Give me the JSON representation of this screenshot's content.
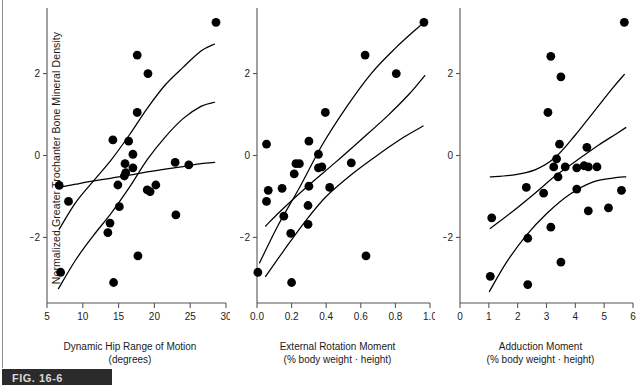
{
  "figure": {
    "caption_label": "FIG. 16-6",
    "shared_ylabel": "Normalized Greater Trochanter Bone Mineral Density",
    "ink_color": "#000000",
    "axis_color": "#555555",
    "background": "#ffffff"
  },
  "chart_data": [
    {
      "type": "scatter",
      "title": "",
      "xlabel": "Dynamic Hip Range of Motion",
      "xlabel_units": "(degrees)",
      "ylabel": "Normalized Greater Trochanter Bone Mineral Density",
      "xlim": [
        5,
        30
      ],
      "ylim": [
        -3.6,
        3.6
      ],
      "xticks": [
        5,
        10,
        15,
        20,
        25,
        30
      ],
      "xticklabels": [
        "5",
        "10",
        "15",
        "20",
        "25",
        "30"
      ],
      "yticks": [
        2,
        0,
        -2
      ],
      "yticklabels": [
        "2",
        "0",
        "-2"
      ],
      "grid": false,
      "legend": "none",
      "points": [
        [
          28.6,
          3.25
        ],
        [
          17.6,
          2.45
        ],
        [
          19.1,
          2.0
        ],
        [
          17.6,
          1.05
        ],
        [
          14.2,
          0.38
        ],
        [
          16.4,
          0.35
        ],
        [
          17.0,
          0.03
        ],
        [
          15.9,
          -0.2
        ],
        [
          17.0,
          -0.3
        ],
        [
          22.9,
          -0.17
        ],
        [
          24.8,
          -0.23
        ],
        [
          16.0,
          -0.42
        ],
        [
          15.8,
          -0.5
        ],
        [
          14.9,
          -0.72
        ],
        [
          6.7,
          -0.73
        ],
        [
          20.2,
          -0.72
        ],
        [
          19.4,
          -0.88
        ],
        [
          19.0,
          -0.84
        ],
        [
          8.0,
          -1.12
        ],
        [
          15.1,
          -1.25
        ],
        [
          23.0,
          -1.45
        ],
        [
          13.8,
          -1.65
        ],
        [
          13.5,
          -1.88
        ],
        [
          17.7,
          -2.45
        ],
        [
          6.9,
          -2.85
        ],
        [
          14.3,
          -3.1
        ]
      ],
      "curves": [
        {
          "name": "upper-confidence-band",
          "points": [
            [
              6.7,
              -1.8
            ],
            [
              9,
              -1.15
            ],
            [
              11.5,
              -0.62
            ],
            [
              14,
              -0.1
            ],
            [
              16.5,
              0.5
            ],
            [
              19,
              1.15
            ],
            [
              21.5,
              1.72
            ],
            [
              24,
              2.15
            ],
            [
              26.5,
              2.55
            ],
            [
              28.4,
              2.72
            ]
          ]
        },
        {
          "name": "regression-fit",
          "points": [
            [
              6.6,
              -3.25
            ],
            [
              9,
              -2.55
            ],
            [
              11.5,
              -1.95
            ],
            [
              14,
              -1.4
            ],
            [
              16.5,
              -0.78
            ],
            [
              19,
              -0.1
            ],
            [
              21.5,
              0.45
            ],
            [
              24,
              0.9
            ],
            [
              26.5,
              1.2
            ],
            [
              28.4,
              1.3
            ]
          ]
        },
        {
          "name": "lower-confidence-band",
          "points": [
            [
              6.6,
              -0.78
            ],
            [
              9,
              -0.7
            ],
            [
              11.5,
              -0.62
            ],
            [
              14,
              -0.55
            ],
            [
              16.5,
              -0.48
            ],
            [
              19,
              -0.4
            ],
            [
              21.5,
              -0.33
            ],
            [
              24,
              -0.27
            ],
            [
              26.5,
              -0.2
            ],
            [
              28.4,
              -0.17
            ]
          ]
        }
      ]
    },
    {
      "type": "scatter",
      "title": "",
      "xlabel": "External Rotation Moment",
      "xlabel_units": "(% body weight · height)",
      "ylabel": "Normalized Greater Trochanter Bone Mineral Density",
      "xlim": [
        0.0,
        1.0
      ],
      "ylim": [
        -3.6,
        3.6
      ],
      "xticks": [
        0.0,
        0.2,
        0.4,
        0.6,
        0.8,
        1.0
      ],
      "xticklabels": [
        "0.0",
        "0.2",
        "0.4",
        "0.6",
        "0.8",
        "1.0"
      ],
      "yticks": [
        2,
        0,
        -2
      ],
      "yticklabels": [
        "2",
        "0",
        "-2"
      ],
      "grid": false,
      "legend": "none",
      "points": [
        [
          0.965,
          3.25
        ],
        [
          0.625,
          2.45
        ],
        [
          0.805,
          2.0
        ],
        [
          0.395,
          1.05
        ],
        [
          0.055,
          0.28
        ],
        [
          0.3,
          0.35
        ],
        [
          0.355,
          0.03
        ],
        [
          0.225,
          -0.2
        ],
        [
          0.245,
          -0.2
        ],
        [
          0.545,
          -0.18
        ],
        [
          0.375,
          -0.28
        ],
        [
          0.355,
          -0.3
        ],
        [
          0.215,
          -0.45
        ],
        [
          0.065,
          -0.85
        ],
        [
          0.145,
          -0.8
        ],
        [
          0.3,
          -0.75
        ],
        [
          0.42,
          -0.78
        ],
        [
          0.055,
          -1.12
        ],
        [
          0.295,
          -1.22
        ],
        [
          0.155,
          -1.48
        ],
        [
          0.295,
          -1.68
        ],
        [
          0.195,
          -1.9
        ],
        [
          0.63,
          -2.45
        ],
        [
          0.005,
          -2.85
        ],
        [
          0.2,
          -3.1
        ]
      ],
      "curves": [
        {
          "name": "upper-confidence-band",
          "points": [
            [
              0.015,
              -2.62
            ],
            [
              0.12,
              -1.72
            ],
            [
              0.25,
              -0.75
            ],
            [
              0.38,
              0.28
            ],
            [
              0.52,
              1.2
            ],
            [
              0.66,
              2.0
            ],
            [
              0.8,
              2.62
            ],
            [
              0.93,
              3.12
            ],
            [
              0.98,
              3.3
            ]
          ]
        },
        {
          "name": "regression-fit",
          "points": [
            [
              0.05,
              -1.72
            ],
            [
              0.15,
              -1.3
            ],
            [
              0.3,
              -0.72
            ],
            [
              0.45,
              -0.18
            ],
            [
              0.6,
              0.38
            ],
            [
              0.75,
              0.95
            ],
            [
              0.88,
              1.5
            ],
            [
              0.97,
              1.95
            ]
          ]
        },
        {
          "name": "lower-confidence-band",
          "points": [
            [
              0.05,
              -2.95
            ],
            [
              0.15,
              -2.35
            ],
            [
              0.28,
              -1.6
            ],
            [
              0.4,
              -1.0
            ],
            [
              0.55,
              -0.45
            ],
            [
              0.7,
              0.02
            ],
            [
              0.85,
              0.45
            ],
            [
              0.96,
              0.72
            ]
          ]
        }
      ]
    },
    {
      "type": "scatter",
      "title": "",
      "xlabel": "Adduction Moment",
      "xlabel_units": "(% body weight · height)",
      "ylabel": "Normalized Greater Trochanter Bone Mineral Density",
      "xlim": [
        0,
        6
      ],
      "ylim": [
        -3.6,
        3.6
      ],
      "xticks": [
        0,
        1,
        2,
        3,
        4,
        5,
        6
      ],
      "xticklabels": [
        "0",
        "1",
        "2",
        "3",
        "4",
        "5",
        "6"
      ],
      "yticks": [
        2,
        0,
        -2
      ],
      "yticklabels": [
        "2",
        "0",
        "-2"
      ],
      "grid": false,
      "legend": "none",
      "points": [
        [
          5.7,
          3.25
        ],
        [
          3.15,
          2.42
        ],
        [
          3.5,
          1.92
        ],
        [
          3.05,
          1.05
        ],
        [
          3.45,
          0.28
        ],
        [
          4.4,
          0.2
        ],
        [
          3.35,
          -0.08
        ],
        [
          3.25,
          -0.28
        ],
        [
          3.65,
          -0.28
        ],
        [
          4.05,
          -0.3
        ],
        [
          4.3,
          -0.25
        ],
        [
          4.45,
          -0.28
        ],
        [
          4.75,
          -0.28
        ],
        [
          3.4,
          -0.52
        ],
        [
          2.3,
          -0.78
        ],
        [
          4.05,
          -0.82
        ],
        [
          5.6,
          -0.85
        ],
        [
          2.9,
          -0.92
        ],
        [
          4.45,
          -1.35
        ],
        [
          5.15,
          -1.28
        ],
        [
          1.1,
          -1.52
        ],
        [
          3.15,
          -1.75
        ],
        [
          2.35,
          -2.02
        ],
        [
          3.5,
          -2.6
        ],
        [
          1.05,
          -2.95
        ],
        [
          2.35,
          -3.15
        ]
      ],
      "curves": [
        {
          "name": "upper-confidence-band",
          "points": [
            [
              1.05,
              -0.52
            ],
            [
              1.8,
              -0.48
            ],
            [
              2.6,
              -0.35
            ],
            [
              3.3,
              -0.05
            ],
            [
              4.0,
              0.5
            ],
            [
              4.7,
              1.12
            ],
            [
              5.3,
              1.65
            ],
            [
              5.7,
              1.98
            ]
          ]
        },
        {
          "name": "regression-fit",
          "points": [
            [
              1.05,
              -1.78
            ],
            [
              1.8,
              -1.38
            ],
            [
              2.6,
              -0.92
            ],
            [
              3.3,
              -0.5
            ],
            [
              4.05,
              -0.12
            ],
            [
              4.8,
              0.25
            ],
            [
              5.4,
              0.52
            ],
            [
              5.75,
              0.68
            ]
          ]
        },
        {
          "name": "lower-confidence-band",
          "points": [
            [
              1.02,
              -3.32
            ],
            [
              1.6,
              -2.62
            ],
            [
              2.3,
              -1.95
            ],
            [
              3.0,
              -1.42
            ],
            [
              3.8,
              -0.95
            ],
            [
              4.6,
              -0.65
            ],
            [
              5.3,
              -0.55
            ],
            [
              5.75,
              -0.52
            ]
          ]
        }
      ]
    }
  ]
}
